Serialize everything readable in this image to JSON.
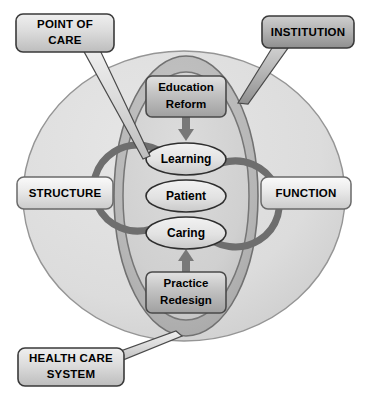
{
  "diagram": {
    "type": "concept-diagram",
    "background_color": "#ffffff",
    "callouts": [
      {
        "id": "point-of-care",
        "lines": [
          "POINT OF",
          "CARE"
        ],
        "text": "POINT OF CARE",
        "position": "top-left",
        "tail_points_to": "learning-ellipse",
        "fill": "#d4d4d4",
        "stroke": "#3a3a3a"
      },
      {
        "id": "institution",
        "lines": [
          "INSTITUTION"
        ],
        "text": "INSTITUTION",
        "position": "top-right",
        "tail_points_to": "institution-ellipse",
        "fill": "#b4b4b4",
        "stroke": "#3a3a3a"
      },
      {
        "id": "health-care-system",
        "lines": [
          "HEALTH CARE",
          "SYSTEM"
        ],
        "text": "HEALTH CARE SYSTEM",
        "position": "bottom-left",
        "tail_points_to": "health-care-system-circle",
        "fill": "#d4d4d4",
        "stroke": "#3a3a3a"
      }
    ],
    "side_labels": [
      {
        "id": "structure",
        "text": "STRUCTURE",
        "position": "left",
        "fill": "#e6e6e6",
        "stroke": "#6a6a6a"
      },
      {
        "id": "function",
        "text": "FUNCTION",
        "position": "right",
        "fill": "#e6e6e6",
        "stroke": "#6a6a6a"
      }
    ],
    "regions": [
      {
        "id": "health-care-system-circle",
        "shape": "circle",
        "label": "health care system",
        "fill": "#dcdcdc",
        "stroke": "#8a8a8a"
      },
      {
        "id": "institution-ellipse",
        "shape": "ellipse",
        "label": "institution",
        "fill": "#b8b8b8",
        "stroke": "#6e6e6e"
      },
      {
        "id": "point-of-care-ellipse",
        "shape": "ellipse",
        "label": "point of care",
        "fill": "#d2d2d2",
        "stroke": "#6e6e6e"
      }
    ],
    "boxes": [
      {
        "id": "education-reform",
        "lines": [
          "Education",
          "Reform"
        ],
        "text": "Education Reform",
        "position": "top-center",
        "fill": "#c8c8c8",
        "stroke": "#4a4a4a"
      },
      {
        "id": "practice-redesign",
        "lines": [
          "Practice",
          "Redesign"
        ],
        "text": "Practice Redesign",
        "position": "bottom-center",
        "fill": "#c8c8c8",
        "stroke": "#4a4a4a"
      }
    ],
    "core_ellipses": [
      {
        "id": "learning",
        "text": "Learning",
        "order": 1,
        "fill": "#e4e4e4",
        "stroke": "#2e2e2e"
      },
      {
        "id": "patient",
        "text": "Patient",
        "order": 2,
        "fill": "#e4e4e4",
        "stroke": "#2e2e2e"
      },
      {
        "id": "caring",
        "text": "Caring",
        "order": 3,
        "fill": "#e4e4e4",
        "stroke": "#2e2e2e"
      }
    ],
    "arrows": [
      {
        "id": "education-reform-down-arrow",
        "direction": "down",
        "from": "education-reform",
        "to": "learning",
        "fill": "#787878"
      },
      {
        "id": "practice-redesign-up-arrow",
        "direction": "up",
        "from": "practice-redesign",
        "to": "caring",
        "fill": "#787878"
      },
      {
        "id": "left-cycle-arc-arrow",
        "direction": "counterclockwise-up",
        "from": "caring",
        "to": "learning",
        "fill": "#6e6e6e"
      },
      {
        "id": "right-cycle-arc-arrow",
        "direction": "clockwise-down",
        "from": "learning",
        "to": "caring",
        "fill": "#6e6e6e"
      }
    ]
  }
}
